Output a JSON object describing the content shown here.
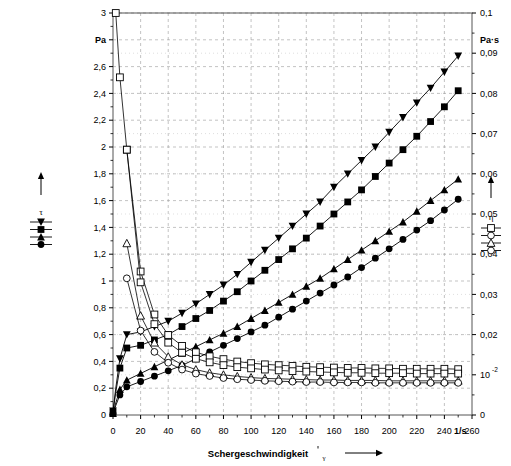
{
  "chart_data": {
    "type": "line",
    "title": "",
    "xlabel": "Schergeschwindigkeit",
    "xlabel_symbol": "γ",
    "xunit": "1/s",
    "xlim": [
      0,
      260
    ],
    "xticks": [
      0,
      20,
      40,
      60,
      80,
      100,
      120,
      140,
      160,
      180,
      200,
      220,
      240,
      260
    ],
    "xticklabels": [
      "0",
      "20",
      "40",
      "60",
      "80",
      "100",
      "120",
      "140",
      "160",
      "180",
      "200",
      "220",
      "240",
      "260"
    ],
    "y_left": {
      "label_symbol": "τ",
      "unit": "Pa",
      "lim": [
        0,
        3
      ],
      "ticks": [
        0,
        0.2,
        0.4,
        0.6,
        0.8,
        1.0,
        1.2,
        1.4,
        1.6,
        1.8,
        2.0,
        2.2,
        2.4,
        2.6,
        2.8,
        3.0
      ],
      "ticklabels": [
        "0",
        "0,2",
        "0,4",
        "0,6",
        "0,8",
        "1",
        "1,2",
        "1,4",
        "1,6",
        "1,8",
        "2",
        "2,2",
        "2,4",
        "2,6",
        "",
        "3"
      ],
      "unit_at": 2.8
    },
    "y_right": {
      "label_symbol": "η",
      "unit": "Pa·s",
      "lim": [
        0,
        0.1
      ],
      "ticks": [
        0,
        0.01,
        0.02,
        0.03,
        0.04,
        0.05,
        0.06,
        0.07,
        0.08,
        0.09,
        0.1
      ],
      "ticklabels": [
        "0",
        "10",
        "0,02",
        "0,03",
        "0,04",
        "0,05",
        "0,06",
        "0,07",
        "0,08",
        "0,09",
        "0,1"
      ],
      "exponent_tick": {
        "value": 0.01,
        "mantissa": "10",
        "exponent": "-2"
      },
      "unit_at": 0.0933
    },
    "grid": true,
    "legend_left": {
      "symbol": "τ",
      "arrow": "up",
      "entries": 4,
      "markers": [
        "filled-down-triangle",
        "filled-square",
        "filled-triangle",
        "filled-circle"
      ]
    },
    "legend_right": {
      "symbol": "η",
      "arrow": "up",
      "entries": 4,
      "markers": [
        "open-square",
        "open-circle",
        "open-triangle",
        "open-circle"
      ]
    },
    "series": [
      {
        "name": "tau-1",
        "axis": "left",
        "marker": "filled-down-triangle",
        "x": [
          0,
          2,
          5,
          10,
          20,
          30,
          40,
          50,
          60,
          70,
          80,
          90,
          100,
          110,
          120,
          130,
          140,
          150,
          160,
          170,
          180,
          190,
          200,
          210,
          220,
          230,
          240,
          250
        ],
        "y": [
          0.03,
          0.2,
          0.42,
          0.6,
          0.62,
          0.66,
          0.7,
          0.76,
          0.83,
          0.9,
          0.97,
          1.05,
          1.14,
          1.23,
          1.32,
          1.41,
          1.5,
          1.59,
          1.7,
          1.8,
          1.9,
          2.0,
          2.11,
          2.22,
          2.33,
          2.44,
          2.56,
          2.68
        ]
      },
      {
        "name": "tau-2",
        "axis": "left",
        "marker": "filled-square",
        "x": [
          0,
          2,
          5,
          10,
          20,
          30,
          40,
          50,
          60,
          70,
          80,
          90,
          100,
          110,
          120,
          130,
          140,
          150,
          160,
          170,
          180,
          190,
          200,
          210,
          220,
          230,
          240,
          250
        ],
        "y": [
          0.02,
          0.17,
          0.35,
          0.5,
          0.52,
          0.56,
          0.6,
          0.66,
          0.72,
          0.78,
          0.85,
          0.92,
          1.0,
          1.08,
          1.16,
          1.24,
          1.32,
          1.41,
          1.5,
          1.59,
          1.68,
          1.78,
          1.88,
          1.98,
          2.08,
          2.19,
          2.3,
          2.42
        ]
      },
      {
        "name": "tau-3",
        "axis": "left",
        "marker": "filled-triangle",
        "x": [
          0,
          2,
          5,
          10,
          20,
          30,
          40,
          50,
          60,
          70,
          80,
          90,
          100,
          110,
          120,
          130,
          140,
          150,
          160,
          170,
          180,
          190,
          200,
          210,
          220,
          230,
          240,
          250
        ],
        "y": [
          0.01,
          0.09,
          0.19,
          0.26,
          0.31,
          0.36,
          0.41,
          0.46,
          0.51,
          0.56,
          0.61,
          0.66,
          0.72,
          0.78,
          0.84,
          0.9,
          0.96,
          1.02,
          1.09,
          1.16,
          1.23,
          1.3,
          1.37,
          1.44,
          1.52,
          1.6,
          1.68,
          1.76
        ]
      },
      {
        "name": "tau-4",
        "axis": "left",
        "marker": "filled-circle",
        "x": [
          0,
          2,
          5,
          10,
          20,
          30,
          40,
          50,
          60,
          70,
          80,
          90,
          100,
          110,
          120,
          130,
          140,
          150,
          160,
          170,
          180,
          190,
          200,
          210,
          220,
          230,
          240,
          250
        ],
        "y": [
          0.01,
          0.07,
          0.15,
          0.21,
          0.25,
          0.29,
          0.33,
          0.37,
          0.42,
          0.47,
          0.52,
          0.57,
          0.62,
          0.67,
          0.73,
          0.79,
          0.85,
          0.91,
          0.97,
          1.03,
          1.1,
          1.17,
          1.24,
          1.31,
          1.38,
          1.45,
          1.53,
          1.61
        ]
      },
      {
        "name": "eta-1",
        "axis": "right",
        "marker": "open-square",
        "x": [
          2,
          5,
          10,
          20,
          30,
          40,
          50,
          60,
          70,
          80,
          90,
          100,
          110,
          120,
          130,
          140,
          150,
          160,
          170,
          180,
          190,
          200,
          210,
          220,
          230,
          240,
          250
        ],
        "y": [
          0.1,
          0.084,
          0.066,
          0.0357,
          0.025,
          0.0199,
          0.0172,
          0.0156,
          0.0146,
          0.0139,
          0.0133,
          0.0129,
          0.0126,
          0.0124,
          0.0122,
          0.012,
          0.0119,
          0.0118,
          0.0117,
          0.0117,
          0.0116,
          0.0116,
          0.0115,
          0.0115,
          0.0115,
          0.0115,
          0.0114
        ]
      },
      {
        "name": "eta-2",
        "axis": "right",
        "marker": "open-square",
        "x": [
          10,
          20,
          30,
          40,
          50,
          60,
          70,
          80,
          90,
          100,
          110,
          120,
          130,
          140,
          150,
          160,
          170,
          180,
          190,
          200,
          210,
          220,
          230,
          240,
          250
        ],
        "y": [
          0.066,
          0.033,
          0.0226,
          0.018,
          0.0155,
          0.014,
          0.0131,
          0.0124,
          0.0119,
          0.0116,
          0.0113,
          0.0111,
          0.0109,
          0.0108,
          0.0107,
          0.0106,
          0.0105,
          0.0105,
          0.0104,
          0.0104,
          0.0104,
          0.0103,
          0.0103,
          0.0103,
          0.0103
        ]
      },
      {
        "name": "eta-3",
        "axis": "right",
        "marker": "open-triangle",
        "x": [
          10,
          20,
          30,
          40,
          50,
          60,
          70,
          80,
          90,
          100,
          110,
          120,
          130,
          140,
          150,
          160,
          170,
          180,
          190,
          200,
          210,
          220,
          230,
          240,
          250
        ],
        "y": [
          0.0427,
          0.0247,
          0.018,
          0.0145,
          0.0125,
          0.0113,
          0.0105,
          0.01,
          0.0096,
          0.0093,
          0.0091,
          0.009,
          0.0089,
          0.0088,
          0.0087,
          0.0087,
          0.0086,
          0.0086,
          0.0086,
          0.0085,
          0.0085,
          0.0085,
          0.0085,
          0.0085,
          0.0085
        ]
      },
      {
        "name": "eta-4",
        "axis": "right",
        "marker": "open-circle",
        "x": [
          10,
          20,
          30,
          40,
          50,
          60,
          70,
          80,
          90,
          100,
          110,
          120,
          130,
          140,
          150,
          160,
          170,
          180,
          190,
          200,
          210,
          220,
          230,
          240,
          250
        ],
        "y": [
          0.034,
          0.021,
          0.0157,
          0.013,
          0.0113,
          0.0103,
          0.0097,
          0.0092,
          0.0089,
          0.0087,
          0.0085,
          0.0084,
          0.0083,
          0.0082,
          0.0082,
          0.0081,
          0.0081,
          0.0081,
          0.008,
          0.008,
          0.008,
          0.008,
          0.008,
          0.008,
          0.008
        ]
      }
    ]
  }
}
